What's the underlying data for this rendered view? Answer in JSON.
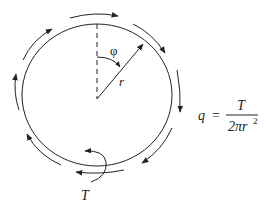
{
  "diagram": {
    "labels": {
      "angle": "φ",
      "radius": "r",
      "torque": "T"
    },
    "formula": {
      "lhs": "q",
      "equals": "=",
      "numerator": "T",
      "denominator_prefix": "2πr",
      "denominator_exponent": "2"
    },
    "shear_flow_direction": "clockwise",
    "shear_arrow_count": 8,
    "colors": {
      "line": "#222222",
      "background": "#ffffff"
    }
  }
}
